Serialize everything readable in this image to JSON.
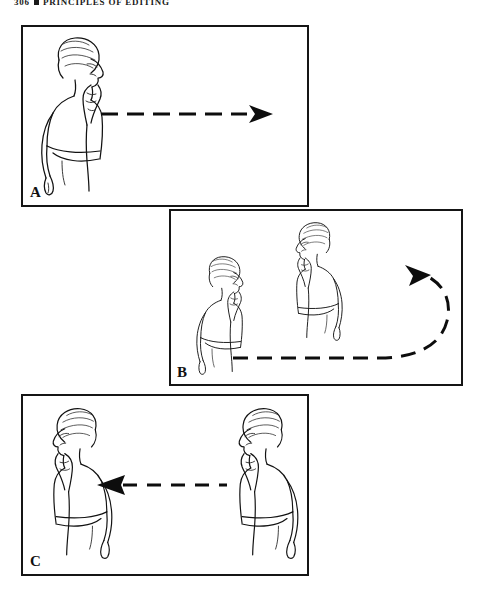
{
  "page": {
    "running_head": {
      "page_number": "306",
      "separator_icon": "square-bullet-icon",
      "title": "PRINCIPLES OF EDITING"
    },
    "background_color": "#ffffff",
    "ink_color": "#121212"
  },
  "figure": {
    "panels": [
      {
        "id": "A",
        "label": "A",
        "subjects": 1,
        "subject_positions": [
          "left"
        ],
        "subject_facing": [
          "right"
        ],
        "subject_pose": "woman in profile, hand raised to shoulder",
        "arrow": {
          "name": "dashed-arrow-right",
          "style": "dashed",
          "direction": "right",
          "shape": "straight",
          "dash_count": 6,
          "color": "#0d0d0d"
        }
      },
      {
        "id": "B",
        "label": "B",
        "subjects": 2,
        "subject_positions": [
          "left",
          "center-right"
        ],
        "subject_facing": [
          "right",
          "left"
        ],
        "subject_pose": "woman in profile, hand raised to shoulder",
        "arrow": {
          "name": "dashed-arrow-u-turn-left",
          "style": "dashed",
          "direction": "left",
          "shape": "u-turn",
          "dash_count": 11,
          "color": "#0d0d0d"
        }
      },
      {
        "id": "C",
        "label": "C",
        "subjects": 2,
        "subject_positions": [
          "left",
          "right"
        ],
        "subject_facing": [
          "left",
          "left"
        ],
        "subject_pose": "woman in profile, hand raised to shoulder",
        "arrow": {
          "name": "dashed-arrow-left",
          "style": "dashed",
          "direction": "left",
          "shape": "straight",
          "dash_count": 4,
          "color": "#0d0d0d"
        }
      }
    ]
  }
}
